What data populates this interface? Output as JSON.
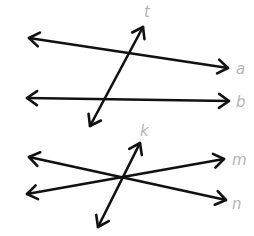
{
  "diagram": {
    "title": "",
    "colors": {
      "line": "#111111",
      "label": "#b5b5b5",
      "background": "#ffffff"
    },
    "figures": [
      {
        "name": "parallel-lines-cut-by-transversal",
        "lines": [
          {
            "id": "a",
            "label": "a",
            "role": "line",
            "both_ends_arrows": true
          },
          {
            "id": "b",
            "label": "b",
            "role": "line",
            "both_ends_arrows": true
          },
          {
            "id": "t",
            "label": "t",
            "role": "transversal",
            "both_ends_arrows": true
          }
        ]
      },
      {
        "name": "three-concurrent-lines",
        "lines": [
          {
            "id": "m",
            "label": "m",
            "role": "line",
            "both_ends_arrows": true
          },
          {
            "id": "n",
            "label": "n",
            "role": "line",
            "both_ends_arrows": true
          },
          {
            "id": "k",
            "label": "k",
            "role": "transversal",
            "both_ends_arrows": true
          }
        ]
      }
    ]
  }
}
